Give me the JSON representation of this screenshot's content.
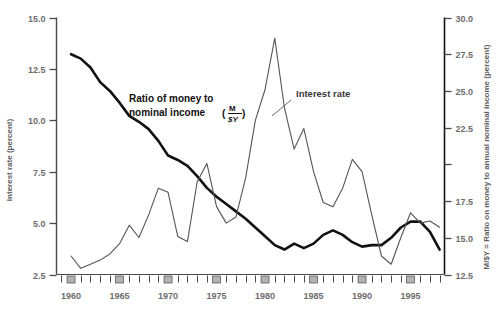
{
  "chart_data": {
    "type": "line",
    "title": "",
    "xlabel": "",
    "ylabel": "Interest rate (percent)",
    "y2label": "M/$Y = Ratio on money to annual nominal income (percent)",
    "xlim": [
      1958.5,
      1998.5
    ],
    "ylim": [
      2.5,
      15.0
    ],
    "y2lim": [
      12.5,
      30.0
    ],
    "grid": false,
    "legend": "inline-annotations",
    "x_tick_labels": [
      "1960",
      "1965",
      "1970",
      "1975",
      "1980",
      "1985",
      "1990",
      "1995"
    ],
    "x_tick_values": [
      1960,
      1965,
      1970,
      1975,
      1980,
      1985,
      1990,
      1995
    ],
    "x_minor_ticks": [
      1959,
      1961,
      1962,
      1963,
      1964,
      1966,
      1967,
      1968,
      1969,
      1971,
      1972,
      1973,
      1974,
      1976,
      1977,
      1978,
      1979,
      1981,
      1982,
      1983,
      1984,
      1986,
      1987,
      1988,
      1989,
      1991,
      1992,
      1993,
      1994,
      1996,
      1997,
      1998
    ],
    "y_left_tick_labels": [
      "2.5",
      "5.0",
      "7.5",
      "10.0",
      "12.5",
      "15.0"
    ],
    "y_left_tick_values": [
      2.5,
      5.0,
      7.5,
      10.0,
      12.5,
      15.0
    ],
    "y_right_tick_labels": [
      "12.5",
      "15.0",
      "17.5",
      "",
      "22.5",
      "25.0",
      "27.5",
      "30.0"
    ],
    "y_right_tick_values": [
      12.5,
      15.0,
      17.5,
      20.0,
      22.5,
      25.0,
      27.5,
      30.0
    ],
    "series": [
      {
        "name": "Ratio of money to nominal income (M/$Y)",
        "axis": "right",
        "color": "#111111",
        "width": 2.6,
        "x": [
          1960,
          1961,
          1962,
          1963,
          1964,
          1965,
          1966,
          1967,
          1968,
          1969,
          1970,
          1971,
          1972,
          1973,
          1974,
          1975,
          1976,
          1977,
          1978,
          1979,
          1980,
          1981,
          1982,
          1983,
          1984,
          1985,
          1986,
          1987,
          1988,
          1989,
          1990,
          1991,
          1992,
          1993,
          1994,
          1995,
          1996,
          1997,
          1998
        ],
        "values": [
          27.5,
          27.2,
          26.6,
          25.6,
          25.0,
          24.2,
          23.3,
          22.9,
          22.4,
          21.6,
          20.6,
          20.3,
          19.9,
          19.2,
          18.4,
          17.8,
          17.3,
          16.8,
          16.3,
          15.7,
          15.1,
          14.5,
          14.2,
          14.6,
          14.3,
          14.6,
          15.2,
          15.5,
          15.2,
          14.7,
          14.4,
          14.5,
          14.5,
          15.0,
          15.7,
          16.1,
          16.1,
          15.4,
          14.2
        ]
      },
      {
        "name": "Interest rate",
        "axis": "left",
        "color": "#555555",
        "width": 1.1,
        "x": [
          1960,
          1961,
          1962,
          1963,
          1964,
          1965,
          1966,
          1967,
          1968,
          1969,
          1970,
          1971,
          1972,
          1973,
          1974,
          1975,
          1976,
          1977,
          1978,
          1979,
          1980,
          1981,
          1982,
          1983,
          1984,
          1985,
          1986,
          1987,
          1988,
          1989,
          1990,
          1991,
          1992,
          1993,
          1994,
          1995,
          1996,
          1997,
          1998
        ],
        "values": [
          3.4,
          2.8,
          3.0,
          3.2,
          3.5,
          4.0,
          4.9,
          4.3,
          5.4,
          6.7,
          6.5,
          4.35,
          4.1,
          7.0,
          7.9,
          5.8,
          5.0,
          5.3,
          7.2,
          10.0,
          11.5,
          14.0,
          10.6,
          8.6,
          9.6,
          7.5,
          6.0,
          5.8,
          6.7,
          8.1,
          7.5,
          5.4,
          3.4,
          3.0,
          4.3,
          5.5,
          5.0,
          5.1,
          4.8
        ]
      }
    ],
    "annotations": [
      {
        "name": "money-ratio-label",
        "line1": "Ratio of money to",
        "line2": "nominal income",
        "fraction_num": "M",
        "fraction_den": "$Y"
      },
      {
        "name": "interest-rate-label",
        "text": "Interest rate"
      }
    ],
    "recession_bars": [
      1960,
      1965,
      1970,
      1975,
      1980,
      1985,
      1990,
      1995
    ],
    "recession_bar_color": "#b3b3b3"
  }
}
